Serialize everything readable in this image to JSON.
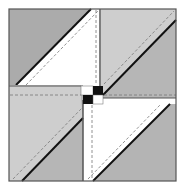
{
  "diagram": {
    "colors": {
      "background": "#ffffff",
      "dark_gray": "#a9a9a9",
      "medium_gray": "#b4b4b4",
      "light_gray": "#cdcdcd",
      "white": "#ffffff",
      "outline": "#555555",
      "seam": "#111111",
      "dashed": "#777777",
      "black": "#111111"
    },
    "quadrants": [
      {
        "name": "top-left",
        "upper_fill": "dark_gray",
        "lower_fill": "white"
      },
      {
        "name": "top-right",
        "upper_fill": "light_gray",
        "lower_fill": "medium_gray"
      },
      {
        "name": "bottom-left",
        "upper_fill": "light_gray",
        "lower_fill": "medium_gray"
      },
      {
        "name": "bottom-right",
        "upper_fill": "white",
        "lower_fill": "medium_gray"
      }
    ],
    "center": {
      "squares": [
        "white",
        "black",
        "black",
        "white"
      ]
    }
  }
}
